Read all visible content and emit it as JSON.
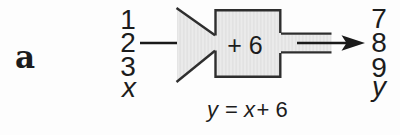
{
  "figure": {
    "part_label": "a",
    "machine": {
      "operation": "+ 6",
      "inputs": [
        "1",
        "2",
        "3",
        "x"
      ],
      "outputs": [
        "7",
        "8",
        "9",
        "y"
      ]
    },
    "formula": {
      "lhs": "y",
      "equals": "=",
      "variable": "x",
      "constant": "+ 6"
    },
    "colors": {
      "background": "#fdfdfd",
      "machine_fill": "#ebebeb",
      "machine_fill_stripe": "#dddddd",
      "line": "#2e2e2e",
      "text": "#1c1c1c"
    }
  }
}
